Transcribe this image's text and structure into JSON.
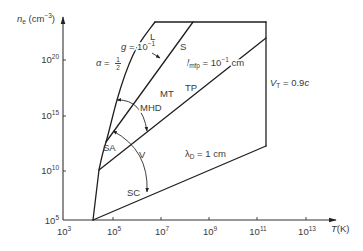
{
  "figure": {
    "colors": {
      "line": "#1f1f1f",
      "text": "#3a3a3a",
      "background": "#ffffff"
    },
    "y_axis": {
      "symbol": "n",
      "subscript": "e",
      "unit_open": " (cm",
      "unit_exp": "−3",
      "unit_close": ")"
    },
    "x_axis": {
      "symbol": "T",
      "unit": "(K)"
    },
    "y_ticks": [
      {
        "base": "10",
        "exp": "5"
      },
      {
        "base": "10",
        "exp": "10"
      },
      {
        "base": "10",
        "exp": "15"
      },
      {
        "base": "10",
        "exp": "20"
      }
    ],
    "x_ticks": [
      {
        "base": "10",
        "exp": "3"
      },
      {
        "base": "10",
        "exp": "5"
      },
      {
        "base": "10",
        "exp": "7"
      },
      {
        "base": "10",
        "exp": "9"
      },
      {
        "base": "10",
        "exp": "11"
      },
      {
        "base": "10",
        "exp": "13"
      }
    ],
    "regions": {
      "L": "L",
      "S": "S",
      "MT": "MT",
      "TP": "TP",
      "MHD": "MHD",
      "SA": "SA",
      "V": "V",
      "SC": "SC"
    },
    "curves": {
      "alpha": {
        "symbol": "α",
        "eq": " = ",
        "num": "1",
        "den": "2"
      },
      "g": {
        "symbol": "g",
        "eq": " = 10",
        "exp": "−1"
      },
      "l_mfp": {
        "symbol": "l",
        "sub": "mfp",
        "eq": " = 10",
        "exp": "−1",
        "unit": " cm"
      },
      "lambda_D": {
        "symbol": "λ",
        "sub": "D",
        "eq": " = 1 cm"
      },
      "V_T": {
        "symbol": "V",
        "sub": "T",
        "eq": " = 0.9",
        "c": "c"
      }
    }
  }
}
